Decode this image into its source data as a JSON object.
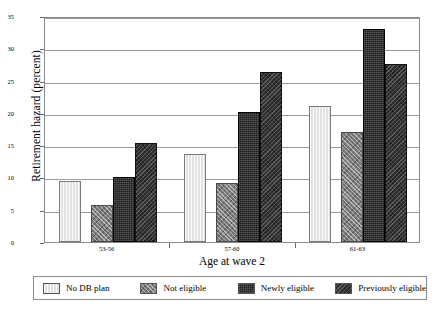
{
  "chart_data": {
    "type": "bar",
    "title": "",
    "xlabel": "Age at wave 2",
    "ylabel": "Retirement hazard (percent)",
    "categories": [
      "53-56",
      "57-60",
      "61-63"
    ],
    "series": [
      {
        "name": "No DB plan",
        "values": [
          9.5,
          13.7,
          21.0
        ]
      },
      {
        "name": "Not eligible",
        "values": [
          5.7,
          9.2,
          17.0
        ]
      },
      {
        "name": "Newly eligible",
        "values": [
          10.0,
          20.1,
          33.0
        ]
      },
      {
        "name": "Previously eligible",
        "values": [
          15.3,
          26.4,
          27.5
        ]
      }
    ],
    "ylim": [
      0,
      35
    ],
    "yticks": [
      0,
      5,
      10,
      15,
      20,
      25,
      30,
      35
    ],
    "ytick_labels": [
      "0",
      "5",
      "10",
      "15",
      "20",
      "25",
      "30",
      "35"
    ],
    "grid": true,
    "legend_position": "bottom"
  },
  "legend": {
    "items": [
      {
        "label": "No DB plan",
        "pattern": "light-vertical",
        "color": "#e2e2e2"
      },
      {
        "label": "Not eligible",
        "pattern": "gray-crosshatch",
        "color": "#7d7d7d"
      },
      {
        "label": "Newly eligible",
        "pattern": "dark-solid",
        "color": "#1e1e1e"
      },
      {
        "label": "Previously eligible",
        "pattern": "dark-hatch",
        "color": "#333333"
      }
    ]
  }
}
